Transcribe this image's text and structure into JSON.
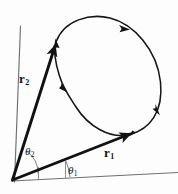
{
  "figure": {
    "background_color": "#fdfdfd",
    "ink_color": "#141414",
    "axis_color": "#6e6e6e",
    "labels": {
      "vector_1": "r",
      "vector_1_sub": "1",
      "vector_2": "r",
      "vector_2_sub": "2",
      "angle_1": "θ",
      "angle_1_sub": "1",
      "angle_2": "θ",
      "angle_2_sub": "2"
    }
  },
  "chart_data": {
    "type": "scatter",
    "xlabel": "",
    "ylabel": "",
    "grid": false,
    "legend": false,
    "origin": {
      "x": 12,
      "y": 180
    },
    "axes": {
      "vertical": {
        "from": {
          "x": 14,
          "y": 182
        },
        "to": {
          "x": 20,
          "y": 26
        }
      },
      "horizontal": {
        "from": {
          "x": 12,
          "y": 181
        },
        "to": {
          "x": 178,
          "y": 173
        }
      }
    },
    "vectors": [
      {
        "name": "r1",
        "label": "r",
        "subscript": "1",
        "tail": {
          "x": 12,
          "y": 180
        },
        "tip": {
          "x": 133,
          "y": 133
        },
        "angle_from_x_axis_deg": 21,
        "label_position": {
          "x": 104,
          "y": 146
        }
      },
      {
        "name": "r2",
        "label": "r",
        "subscript": "2",
        "tail": {
          "x": 12,
          "y": 180
        },
        "tip": {
          "x": 56,
          "y": 42
        },
        "angle_from_x_axis_deg": 72,
        "label_position": {
          "x": 19,
          "y": 72
        }
      }
    ],
    "angles": [
      {
        "name": "theta1",
        "label": "θ",
        "subscript": "1",
        "between": [
          "x-axis",
          "r1"
        ],
        "value_deg": 21,
        "arc_radius": 56,
        "label_position": {
          "x": 68,
          "y": 165
        }
      },
      {
        "name": "theta2",
        "label": "θ",
        "subscript": "2",
        "between": [
          "x-axis",
          "r2"
        ],
        "value_deg": 72,
        "arc_radius": 38,
        "label_position": {
          "x": 25,
          "y": 146
        }
      }
    ],
    "curve": {
      "name": "closed-orbit",
      "closed": true,
      "direction": "clockwise",
      "marked_points": [
        {
          "x": 56,
          "y": 42,
          "type": "arrowhead",
          "note": "tip of r2 on curve"
        },
        {
          "x": 133,
          "y": 133,
          "type": "arrowhead",
          "note": "tip of r1 on curve"
        },
        {
          "x": 124,
          "y": 27,
          "type": "arrowhead",
          "note": "upper-right of curve"
        },
        {
          "x": 157,
          "y": 110,
          "type": "arrowhead",
          "note": "right of curve"
        },
        {
          "x": 64,
          "y": 89,
          "type": "arrowhead",
          "note": "left waist of curve"
        }
      ],
      "path": "M 56 42 C 62 22, 86 14, 108 18 C 134 23, 156 48, 160 80 C 164 110, 150 128, 130 134 C 108 140, 86 124, 74 106 C 66 94, 62 88, 58 74 C 54 60, 53 50, 56 42 Z"
    }
  }
}
